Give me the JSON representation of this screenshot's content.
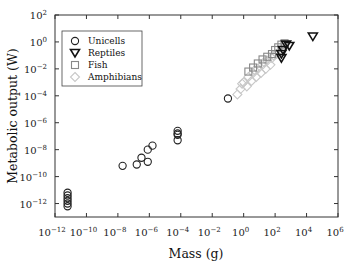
{
  "chart_data": {
    "type": "scatter",
    "title": "",
    "xlabel": "Mass (g)",
    "ylabel": "Metabolic output (W)",
    "xscale": "log",
    "yscale": "log",
    "xlim": [
      1e-12,
      1000000.0
    ],
    "ylim": [
      1e-13,
      100.0
    ],
    "x_ticks": [
      -12,
      -10,
      -8,
      -6,
      -4,
      -2,
      0,
      2,
      4,
      6
    ],
    "y_ticks": [
      -12,
      -10,
      -8,
      -6,
      -4,
      -2,
      0,
      2
    ],
    "x_tick_labels": [
      "10^-12",
      "10^-10",
      "10^-8",
      "10^-6",
      "10^-4",
      "10^-2",
      "10^0",
      "10^2",
      "10^4",
      "10^6"
    ],
    "y_tick_labels": [
      "10^-12",
      "10^-10",
      "10^-8",
      "10^-6",
      "10^-4",
      "10^-2",
      "10^0",
      "10^2"
    ],
    "grid": false,
    "legend_position": "upper left",
    "series": [
      {
        "name": "Unicells",
        "marker": "circle",
        "color": "#222222",
        "points_log10": [
          [
            -11.2,
            -11.2
          ],
          [
            -11.2,
            -11.4
          ],
          [
            -11.2,
            -11.6
          ],
          [
            -11.2,
            -11.8
          ],
          [
            -11.2,
            -12.0
          ],
          [
            -11.2,
            -12.2
          ],
          [
            -7.7,
            -9.2
          ],
          [
            -6.8,
            -9.1
          ],
          [
            -6.5,
            -8.6
          ],
          [
            -6.1,
            -8.9
          ],
          [
            -6.1,
            -8.0
          ],
          [
            -5.8,
            -7.7
          ],
          [
            -4.2,
            -6.6
          ],
          [
            -4.2,
            -6.8
          ],
          [
            -4.2,
            -6.9
          ],
          [
            -4.2,
            -7.3
          ],
          [
            -1.0,
            -4.2
          ]
        ]
      },
      {
        "name": "Reptiles",
        "marker": "triangle-down",
        "color": "#111111",
        "points_log10": [
          [
            4.4,
            0.4
          ],
          [
            2.9,
            -0.3
          ],
          [
            2.7,
            -0.2
          ],
          [
            2.5,
            -0.6
          ],
          [
            2.4,
            -0.9
          ],
          [
            2.4,
            -1.2
          ]
        ]
      },
      {
        "name": "Fish",
        "marker": "square",
        "color": "#888888",
        "points_log10": [
          [
            2.4,
            -0.2
          ],
          [
            2.6,
            -0.1
          ],
          [
            2.2,
            -0.4
          ],
          [
            2.0,
            -0.6
          ],
          [
            1.8,
            -0.9
          ],
          [
            1.5,
            -1.1
          ],
          [
            1.2,
            -1.3
          ],
          [
            0.9,
            -1.6
          ],
          [
            0.6,
            -1.9
          ],
          [
            0.3,
            -2.2
          ]
        ]
      },
      {
        "name": "Amphibians",
        "marker": "diamond",
        "color": "#c8c8c8",
        "points_log10": [
          [
            -0.2,
            -3.5
          ],
          [
            -0.4,
            -3.9
          ],
          [
            0.0,
            -3.0
          ],
          [
            0.3,
            -2.6
          ],
          [
            0.6,
            -2.3
          ],
          [
            0.9,
            -2.0
          ],
          [
            1.2,
            -1.7
          ],
          [
            1.5,
            -1.4
          ],
          [
            1.8,
            -1.2
          ],
          [
            2.1,
            -0.9
          ],
          [
            0.2,
            -3.3
          ],
          [
            0.5,
            -2.9
          ],
          [
            0.8,
            -2.6
          ],
          [
            1.1,
            -2.3
          ],
          [
            1.4,
            -2.0
          ],
          [
            1.7,
            -1.7
          ],
          [
            -0.1,
            -3.1
          ],
          [
            0.7,
            -2.1
          ],
          [
            1.3,
            -1.5
          ],
          [
            1.9,
            -1.0
          ]
        ]
      }
    ]
  },
  "legend": {
    "items": [
      {
        "label": "Unicells",
        "marker": "circle"
      },
      {
        "label": "Reptiles",
        "marker": "triangle-down"
      },
      {
        "label": "Fish",
        "marker": "square"
      },
      {
        "label": "Amphibians",
        "marker": "diamond"
      }
    ]
  },
  "axes": {
    "x_title": "Mass (g)",
    "y_title": "Metabolic output (W)"
  },
  "colors": {
    "axis": "#333333",
    "unicells": "#222222",
    "reptiles": "#111111",
    "fish": "#888888",
    "amphibians": "#c8c8c8"
  }
}
